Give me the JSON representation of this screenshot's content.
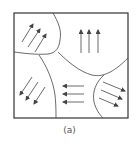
{
  "figure": {
    "caption": "(a)",
    "line_color": "#333333",
    "arrow_color": "#444444",
    "domains": [
      {
        "name": "top-left",
        "arrow_direction": "up-right",
        "arrow_count": 3
      },
      {
        "name": "top-right",
        "arrow_direction": "up",
        "arrow_count": 3
      },
      {
        "name": "bottom-left",
        "arrow_direction": "down-left",
        "arrow_count": 3
      },
      {
        "name": "bottom-center",
        "arrow_direction": "left",
        "arrow_count": 3
      },
      {
        "name": "bottom-right",
        "arrow_direction": "down-right",
        "arrow_count": 3
      }
    ]
  }
}
